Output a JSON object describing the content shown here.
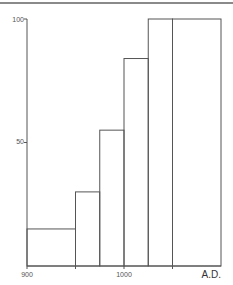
{
  "chart_data": {
    "type": "bar",
    "title": "",
    "xlabel": "A.D.",
    "ylabel": "",
    "x_ticks": [
      900,
      1000
    ],
    "x_minor_ticks": [
      950,
      1050
    ],
    "y_ticks": [
      50,
      100
    ],
    "xlim": [
      900,
      1100
    ],
    "ylim": [
      0,
      100
    ],
    "grid": false,
    "legend": null,
    "bins": [
      {
        "start": 900,
        "end": 950,
        "value": 15
      },
      {
        "start": 950,
        "end": 975,
        "value": 30
      },
      {
        "start": 975,
        "end": 1000,
        "value": 55
      },
      {
        "start": 1000,
        "end": 1025,
        "value": 84
      },
      {
        "start": 1025,
        "end": 1050,
        "value": 100
      },
      {
        "start": 1050,
        "end": 1100,
        "value": 100
      }
    ],
    "categories": [
      "900-950",
      "950-975",
      "975-1000",
      "1000-1025",
      "1025-1050",
      "1050-1100"
    ],
    "values": [
      15,
      30,
      55,
      84,
      100,
      100
    ]
  },
  "labels": {
    "y100": "100",
    "y50": "50",
    "x900": "900",
    "x1000": "1000",
    "xunit": "A.D."
  },
  "colors": {
    "line": "#555555"
  }
}
